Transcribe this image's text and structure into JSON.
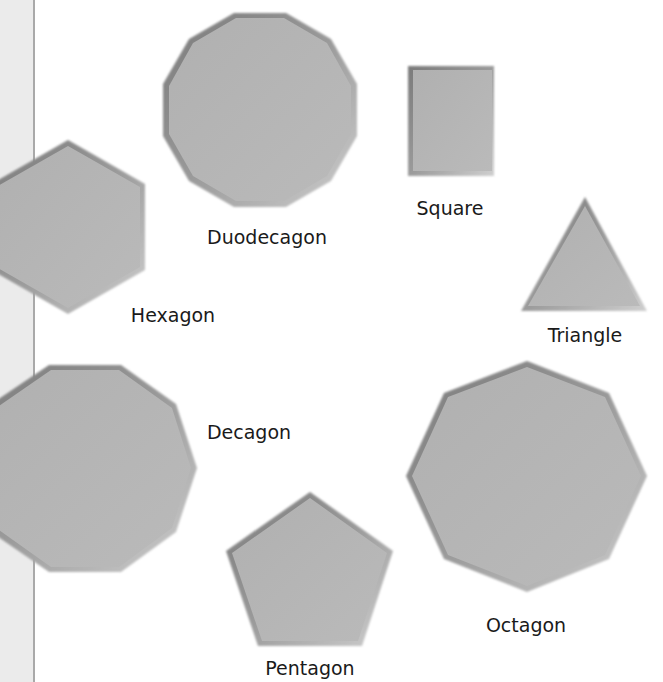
{
  "colors": {
    "shape_fill": "#b3b3b3",
    "shape_shadow": "#6e6e6e",
    "shape_highlight": "#e6e6e6",
    "label": "#1a1a1a",
    "strip_bg": "#ebebeb",
    "strip_line": "#a9a9a9"
  },
  "shapes": [
    {
      "name": "Duodecagon",
      "sides": 12,
      "label": "Duodecagon"
    },
    {
      "name": "Square",
      "sides": 4,
      "label": "Square"
    },
    {
      "name": "Triangle",
      "sides": 3,
      "label": "Triangle"
    },
    {
      "name": "Hexagon",
      "sides": 6,
      "label": "Hexagon"
    },
    {
      "name": "Decagon",
      "sides": 10,
      "label": "Decagon"
    },
    {
      "name": "Pentagon",
      "sides": 5,
      "label": "Pentagon"
    },
    {
      "name": "Octagon",
      "sides": 8,
      "label": "Octagon"
    }
  ]
}
